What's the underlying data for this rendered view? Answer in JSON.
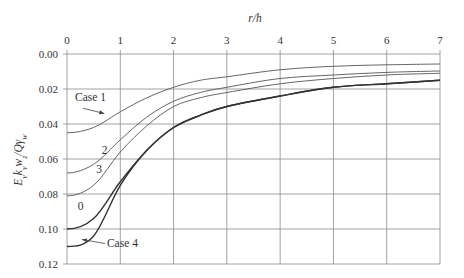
{
  "chart_data": {
    "type": "line",
    "title": "",
    "xlabel": "r/h",
    "ylabel": "E_v k_v w_z / Q γ_w",
    "xlim": [
      0,
      7
    ],
    "ylim": [
      0.12,
      0.0
    ],
    "y_inverted": true,
    "x_axis_position": "top",
    "grid": true,
    "x_ticks": [
      "0",
      "1",
      "2",
      "3",
      "4",
      "5",
      "6",
      "7"
    ],
    "y_ticks": [
      "0.00",
      "0.02",
      "0.04",
      "0.06",
      "0.08",
      "0.10",
      "0.12"
    ],
    "x": [
      0,
      0.5,
      1,
      1.5,
      2,
      2.5,
      3,
      4,
      5,
      6,
      7
    ],
    "series": [
      {
        "name": "Case 1",
        "values": [
          0.045,
          0.042,
          0.033,
          0.025,
          0.019,
          0.015,
          0.013,
          0.009,
          0.007,
          0.0062,
          0.0057
        ]
      },
      {
        "name": "2",
        "values": [
          0.068,
          0.063,
          0.049,
          0.036,
          0.027,
          0.022,
          0.019,
          0.014,
          0.012,
          0.0105,
          0.0097
        ]
      },
      {
        "name": "3",
        "values": [
          0.081,
          0.075,
          0.056,
          0.041,
          0.03,
          0.025,
          0.022,
          0.017,
          0.014,
          0.012,
          0.011
        ]
      },
      {
        "name": "0",
        "values": [
          0.1,
          0.094,
          0.073,
          0.055,
          0.042,
          0.035,
          0.03,
          0.024,
          0.019,
          0.017,
          0.015
        ]
      },
      {
        "name": "Case 4",
        "values": [
          0.11,
          0.104,
          0.075,
          0.055,
          0.042,
          0.035,
          0.03,
          0.024,
          0.019,
          0.017,
          0.015
        ]
      }
    ],
    "annotations": [
      {
        "text": "Case 1",
        "x": 0.15,
        "y": 0.027,
        "arrow_to": [
          0.7,
          0.034
        ]
      },
      {
        "text": "2",
        "x": 0.65,
        "y": 0.057
      },
      {
        "text": "3",
        "x": 0.55,
        "y": 0.068
      },
      {
        "text": "0",
        "x": 0.2,
        "y": 0.089
      },
      {
        "text": "Case 4",
        "x": 0.75,
        "y": 0.11,
        "arrow_to": [
          0.28,
          0.106
        ]
      }
    ]
  }
}
